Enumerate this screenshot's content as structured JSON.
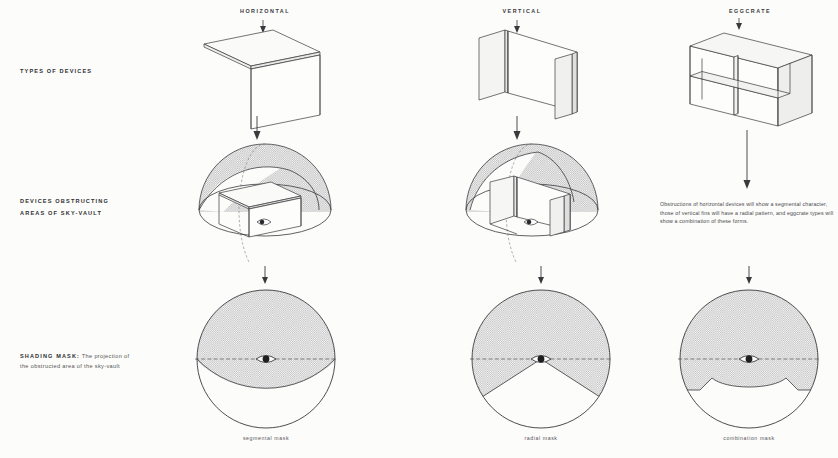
{
  "figure": {
    "title_implicit": "Shading devices and their sky-vault obstruction masks",
    "background_color": "#fcfcfa",
    "line_color": "#3a3a3e",
    "shade_fill": "#cfcfcf",
    "shade_fill_dark": "#b9b9b9"
  },
  "row_labels": {
    "types": "TYPES OF DEVICES",
    "obstructing_line1": "DEVICES OBSTRUCTING",
    "obstructing_line2": "AREAS OF SKY-VAULT",
    "shading_lead": "SHADING MASK:",
    "shading_tail_line1": " The projection of",
    "shading_tail_line2": "the obstructed area of the sky-vault"
  },
  "columns": [
    {
      "id": "horizontal",
      "header": "HORIZONTAL",
      "device_type": "horizontal-overhang",
      "caption": "segmental mask",
      "mask_type": "segmental"
    },
    {
      "id": "vertical",
      "header": "VERTICAL",
      "device_type": "vertical-fin",
      "caption": "radial mask",
      "mask_type": "radial"
    },
    {
      "id": "eggcrate",
      "header": "EGGCRATE",
      "device_type": "eggcrate-grid",
      "caption": "combination mask",
      "mask_type": "combination"
    }
  ],
  "note": "Obstructions of horizontal devices will show a segmental character, those of vertical fins will have a radial pattern, and eggcrate types will show a combination of these forms.",
  "icons": {
    "arrow_down": "down-arrow-icon",
    "eye": "eye-icon"
  }
}
